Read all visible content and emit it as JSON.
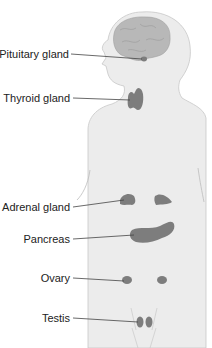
{
  "colors": {
    "body_fill": "#ececec",
    "body_stroke": "#c8c8c8",
    "brain_fill": "#b8b8b8",
    "gland_fill": "#7d7d7d",
    "leader_line": "#444444",
    "label_text": "#222222"
  },
  "labels": [
    {
      "id": "pituitary",
      "text": "Pituitary gland"
    },
    {
      "id": "thyroid",
      "text": "Thyroid gland"
    },
    {
      "id": "adrenal",
      "text": "Adrenal gland"
    },
    {
      "id": "pancreas",
      "text": "Pancreas"
    },
    {
      "id": "ovary",
      "text": "Ovary"
    },
    {
      "id": "testis",
      "text": "Testis"
    }
  ]
}
